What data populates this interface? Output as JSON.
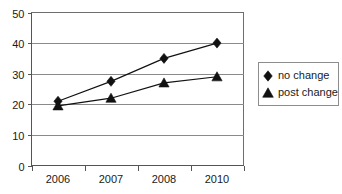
{
  "chart_data": {
    "type": "line",
    "title": "",
    "xlabel": "",
    "ylabel": "",
    "categories": [
      "2006",
      "2007",
      "2008",
      "2010"
    ],
    "x_tick_labels": [
      "2006",
      "2007",
      "2008",
      "2010"
    ],
    "y_tick_labels": [
      "0",
      "10",
      "20",
      "30",
      "40",
      "50"
    ],
    "y_tick_values": [
      0,
      10,
      20,
      30,
      40,
      50
    ],
    "ylim": [
      0,
      50
    ],
    "grid": "horizontal",
    "legend_position": "right",
    "series": [
      {
        "name": "no change",
        "marker": "diamond",
        "color": "#111111",
        "values": [
          21,
          27.5,
          35,
          40
        ]
      },
      {
        "name": "post change",
        "marker": "triangle",
        "color": "#111111",
        "values": [
          19.5,
          22,
          27,
          29
        ]
      }
    ]
  },
  "legend": {
    "entries": [
      {
        "label": "no change",
        "marker": "diamond"
      },
      {
        "label": "post change",
        "marker": "triangle"
      }
    ]
  }
}
